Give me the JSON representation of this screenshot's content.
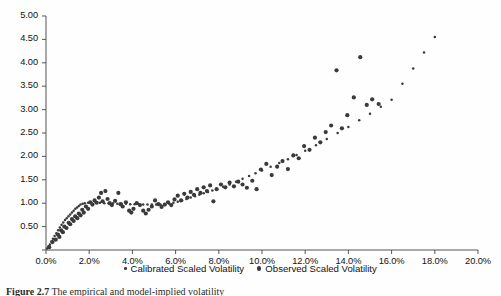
{
  "figure": {
    "caption_label": "Figure 2.7",
    "caption_text": "The empirical and model-implied volatility"
  },
  "legend": {
    "position": "bottom-center",
    "items": [
      {
        "label": "Calibrated Scaled Volatility",
        "marker": "small-dot",
        "color": "#3a3a3a"
      },
      {
        "label": "Observed Scaled Volatility",
        "marker": "large-dot",
        "color": "#3a3a3a"
      }
    ]
  },
  "chart_data": {
    "type": "scatter",
    "title": "",
    "xlabel": "",
    "ylabel": "",
    "xlim": [
      0.0,
      20.0
    ],
    "ylim": [
      0.0,
      5.0
    ],
    "grid": false,
    "x_tick_labels": [
      "0.0%",
      "2.0%",
      "4.0%",
      "6.0%",
      "8.0%",
      "10.0%",
      "12.0%",
      "14.0%",
      "16.0%",
      "18.0%",
      "20.0%"
    ],
    "x_ticks": [
      0,
      2,
      4,
      6,
      8,
      10,
      12,
      14,
      16,
      18,
      20
    ],
    "y_tick_labels": [
      "0.00",
      "0.50",
      "1.00",
      "1.50",
      "2.00",
      "2.50",
      "3.00",
      "3.50",
      "4.00",
      "4.50",
      "5.00"
    ],
    "y_ticks": [
      0,
      0.5,
      1,
      1.5,
      2,
      2.5,
      3,
      3.5,
      4,
      4.5,
      5
    ],
    "series": [
      {
        "name": "Calibrated Scaled Volatility",
        "marker": "small-dot",
        "color": "#3a3a3a",
        "point_radius": 1.25,
        "points": [
          [
            0.05,
            0.03
          ],
          [
            0.12,
            0.08
          ],
          [
            0.18,
            0.12
          ],
          [
            0.25,
            0.18
          ],
          [
            0.32,
            0.24
          ],
          [
            0.4,
            0.3
          ],
          [
            0.48,
            0.36
          ],
          [
            0.56,
            0.42
          ],
          [
            0.64,
            0.48
          ],
          [
            0.72,
            0.54
          ],
          [
            0.8,
            0.59
          ],
          [
            0.88,
            0.64
          ],
          [
            0.96,
            0.68
          ],
          [
            1.04,
            0.72
          ],
          [
            1.12,
            0.76
          ],
          [
            1.2,
            0.8
          ],
          [
            1.28,
            0.84
          ],
          [
            1.36,
            0.88
          ],
          [
            1.44,
            0.91
          ],
          [
            1.52,
            0.94
          ],
          [
            1.6,
            0.97
          ],
          [
            1.7,
            0.99
          ],
          [
            1.8,
            1.0
          ],
          [
            1.95,
            1.01
          ],
          [
            2.1,
            1.01
          ],
          [
            2.3,
            1.01
          ],
          [
            2.5,
            1.01
          ],
          [
            2.7,
            1.0
          ],
          [
            2.9,
            1.0
          ],
          [
            3.1,
            1.0
          ],
          [
            3.3,
            0.99
          ],
          [
            3.5,
            0.99
          ],
          [
            3.7,
            0.99
          ],
          [
            3.9,
            0.98
          ],
          [
            4.1,
            0.98
          ],
          [
            4.3,
            0.98
          ],
          [
            4.5,
            0.97
          ],
          [
            4.7,
            0.97
          ],
          [
            4.9,
            0.97
          ],
          [
            5.1,
            0.97
          ],
          [
            5.3,
            0.97
          ],
          [
            5.5,
            0.98
          ],
          [
            5.7,
            0.99
          ],
          [
            5.9,
            1.01
          ],
          [
            6.1,
            1.03
          ],
          [
            6.3,
            1.06
          ],
          [
            6.5,
            1.09
          ],
          [
            6.7,
            1.12
          ],
          [
            6.9,
            1.15
          ],
          [
            7.1,
            1.18
          ],
          [
            7.3,
            1.21
          ],
          [
            7.5,
            1.24
          ],
          [
            7.7,
            1.27
          ],
          [
            7.9,
            1.3
          ],
          [
            8.2,
            1.35
          ],
          [
            8.5,
            1.4
          ],
          [
            8.8,
            1.46
          ],
          [
            9.1,
            1.52
          ],
          [
            9.4,
            1.58
          ],
          [
            9.7,
            1.64
          ],
          [
            10.0,
            1.7
          ],
          [
            10.4,
            1.78
          ],
          [
            10.8,
            1.86
          ],
          [
            11.2,
            1.94
          ],
          [
            11.6,
            2.03
          ],
          [
            12.0,
            2.12
          ],
          [
            12.5,
            2.24
          ],
          [
            13.0,
            2.37
          ],
          [
            13.5,
            2.5
          ],
          [
            14.0,
            2.63
          ],
          [
            14.5,
            2.77
          ],
          [
            15.0,
            2.91
          ],
          [
            15.5,
            3.06
          ],
          [
            16.0,
            3.21
          ],
          [
            16.5,
            3.55
          ],
          [
            17.0,
            3.88
          ],
          [
            17.5,
            4.22
          ],
          [
            18.0,
            4.55
          ]
        ],
        "description": "Dense calibrated curve: steep concave rise from origin to ~1.0 at 1.8%, flat plateau near 1.0 through 5.5%, then near-linear increase to ~4.55 at 18%"
      },
      {
        "name": "Observed Scaled Volatility",
        "marker": "large-dot",
        "color": "#3a3a3a",
        "point_radius": 2.1,
        "points": [
          [
            0.15,
            0.06
          ],
          [
            0.3,
            0.17
          ],
          [
            0.45,
            0.22
          ],
          [
            0.55,
            0.33
          ],
          [
            0.62,
            0.28
          ],
          [
            0.7,
            0.42
          ],
          [
            0.78,
            0.38
          ],
          [
            0.85,
            0.5
          ],
          [
            0.95,
            0.47
          ],
          [
            1.05,
            0.58
          ],
          [
            1.12,
            0.55
          ],
          [
            1.2,
            0.66
          ],
          [
            1.28,
            0.62
          ],
          [
            1.35,
            0.72
          ],
          [
            1.45,
            0.68
          ],
          [
            1.52,
            0.78
          ],
          [
            1.6,
            0.74
          ],
          [
            1.68,
            0.86
          ],
          [
            1.75,
            0.8
          ],
          [
            1.85,
            0.93
          ],
          [
            1.95,
            0.88
          ],
          [
            2.05,
            1.02
          ],
          [
            2.15,
            0.97
          ],
          [
            2.25,
            1.06
          ],
          [
            2.35,
            1.01
          ],
          [
            2.45,
            1.12
          ],
          [
            2.55,
            1.22
          ],
          [
            2.62,
            1.04
          ],
          [
            2.75,
            1.26
          ],
          [
            2.85,
            1.09
          ],
          [
            2.95,
            1.0
          ],
          [
            3.05,
            0.96
          ],
          [
            3.2,
            1.05
          ],
          [
            3.35,
            1.22
          ],
          [
            3.45,
            0.98
          ],
          [
            3.55,
            0.93
          ],
          [
            3.7,
            1.02
          ],
          [
            3.85,
            0.84
          ],
          [
            3.95,
            0.8
          ],
          [
            4.05,
            0.88
          ],
          [
            4.2,
            1.0
          ],
          [
            4.35,
            0.96
          ],
          [
            4.5,
            0.84
          ],
          [
            4.62,
            0.78
          ],
          [
            4.75,
            0.86
          ],
          [
            4.9,
            0.93
          ],
          [
            5.05,
            1.06
          ],
          [
            5.2,
            0.98
          ],
          [
            5.35,
            0.92
          ],
          [
            5.5,
            0.97
          ],
          [
            5.65,
            1.02
          ],
          [
            5.8,
            0.96
          ],
          [
            5.95,
            1.08
          ],
          [
            6.1,
            1.16
          ],
          [
            6.25,
            1.06
          ],
          [
            6.4,
            1.2
          ],
          [
            6.55,
            1.12
          ],
          [
            6.7,
            1.24
          ],
          [
            6.85,
            1.18
          ],
          [
            7.0,
            1.3
          ],
          [
            7.15,
            1.22
          ],
          [
            7.3,
            1.34
          ],
          [
            7.45,
            1.26
          ],
          [
            7.6,
            1.38
          ],
          [
            7.75,
            1.04
          ],
          [
            7.9,
            1.3
          ],
          [
            8.1,
            1.4
          ],
          [
            8.3,
            1.34
          ],
          [
            8.5,
            1.44
          ],
          [
            8.7,
            1.36
          ],
          [
            8.9,
            1.46
          ],
          [
            9.1,
            1.4
          ],
          [
            9.3,
            1.33
          ],
          [
            9.55,
            1.48
          ],
          [
            9.75,
            1.3
          ],
          [
            9.95,
            1.72
          ],
          [
            10.2,
            1.84
          ],
          [
            10.45,
            1.6
          ],
          [
            10.7,
            1.78
          ],
          [
            10.95,
            1.9
          ],
          [
            11.2,
            1.73
          ],
          [
            11.45,
            2.02
          ],
          [
            11.7,
            1.96
          ],
          [
            11.95,
            2.22
          ],
          [
            12.2,
            2.14
          ],
          [
            12.45,
            2.4
          ],
          [
            12.7,
            2.3
          ],
          [
            12.95,
            2.52
          ],
          [
            13.2,
            2.66
          ],
          [
            13.45,
            3.84
          ],
          [
            13.7,
            2.6
          ],
          [
            13.95,
            2.88
          ],
          [
            14.25,
            3.26
          ],
          [
            14.55,
            4.12
          ],
          [
            14.85,
            3.1
          ],
          [
            15.1,
            3.22
          ],
          [
            15.4,
            3.12
          ]
        ],
        "description": "Scattered observed points dispersed about the calibrated curve, with two high outliers near 13.5% (3.84) and 14.6% (4.12)"
      }
    ]
  }
}
